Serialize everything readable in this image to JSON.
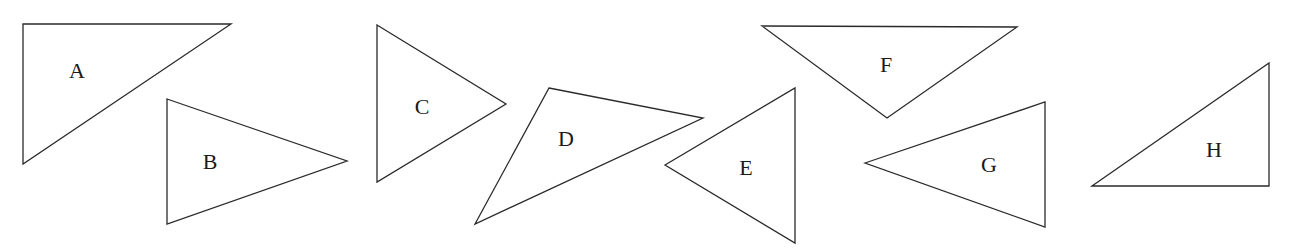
{
  "diagram": {
    "title": "",
    "stroke_color": "#2a2a2a",
    "background": "#ffffff",
    "triangles": [
      {
        "label": "A",
        "points": [
          [
            23,
            24
          ],
          [
            231,
            24
          ],
          [
            23,
            164
          ]
        ],
        "label_pos": [
          77,
          70
        ]
      },
      {
        "label": "B",
        "points": [
          [
            167,
            99
          ],
          [
            347,
            161
          ],
          [
            167,
            224
          ]
        ],
        "label_pos": [
          210,
          161
        ]
      },
      {
        "label": "C",
        "points": [
          [
            377,
            25
          ],
          [
            506,
            104
          ],
          [
            377,
            182
          ]
        ],
        "label_pos": [
          422,
          106
        ]
      },
      {
        "label": "D",
        "points": [
          [
            549,
            88
          ],
          [
            703,
            118
          ],
          [
            475,
            224
          ]
        ],
        "label_pos": [
          566,
          138
        ]
      },
      {
        "label": "E",
        "points": [
          [
            665,
            165
          ],
          [
            795,
            88
          ],
          [
            795,
            243
          ]
        ],
        "label_pos": [
          746,
          167
        ]
      },
      {
        "label": "F",
        "points": [
          [
            762,
            26
          ],
          [
            1017,
            27
          ],
          [
            887,
            118
          ]
        ],
        "label_pos": [
          886,
          64
        ]
      },
      {
        "label": "G",
        "points": [
          [
            865,
            163
          ],
          [
            1045,
            102
          ],
          [
            1045,
            227
          ]
        ],
        "label_pos": [
          989,
          164
        ]
      },
      {
        "label": "H",
        "points": [
          [
            1092,
            186
          ],
          [
            1269,
            63
          ],
          [
            1269,
            186
          ]
        ],
        "label_pos": [
          1214,
          149
        ]
      }
    ]
  }
}
